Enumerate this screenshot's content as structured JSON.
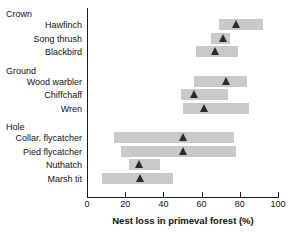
{
  "chart_data": {
    "type": "bar",
    "title": "",
    "xlabel": "Nest loss in primeval forest (%)",
    "ylabel": "",
    "xlim": [
      0,
      100
    ],
    "xticks": [
      0,
      20,
      40,
      60,
      80,
      100
    ],
    "xtick_labels": [
      "0",
      "20",
      "40",
      "60",
      "80",
      "100"
    ],
    "grid": false,
    "legend": "none",
    "orientation": "horizontal",
    "groups": [
      {
        "name": "Crown",
        "species": [
          {
            "label": "Hawfinch",
            "low": 69,
            "high": 92,
            "value": 78
          },
          {
            "label": "Song thrush",
            "low": 65,
            "high": 75,
            "value": 71
          },
          {
            "label": "Blackbird",
            "low": 57,
            "high": 79,
            "value": 67
          }
        ]
      },
      {
        "name": "Ground",
        "species": [
          {
            "label": "Wood warbler",
            "low": 56,
            "high": 84,
            "value": 73
          },
          {
            "label": "Chiffchaff",
            "low": 49,
            "high": 74,
            "value": 56
          },
          {
            "label": "Wren",
            "low": 50,
            "high": 85,
            "value": 61
          }
        ]
      },
      {
        "name": "Hole",
        "species": [
          {
            "label": "Collar. flycatcher",
            "low": 14,
            "high": 77,
            "value": 50
          },
          {
            "label": "Pied flycatcher",
            "low": 18,
            "high": 78,
            "value": 50
          },
          {
            "label": "Nuthatch",
            "low": 22,
            "high": 38,
            "value": 27
          },
          {
            "label": "Marsh tit",
            "low": 8,
            "high": 45,
            "value": 28
          }
        ]
      }
    ],
    "colors": {
      "bar": "#c9c9c9",
      "marker": "#2b2b2b",
      "axis": "#1a1a1a",
      "text": "#111111",
      "background": "#ffffff"
    }
  }
}
